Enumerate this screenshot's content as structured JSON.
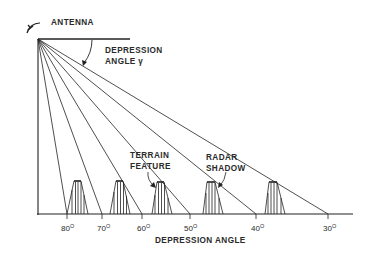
{
  "diagram": {
    "labels": {
      "antenna": "ANTENNA",
      "depression_line1": "DEPRESSION",
      "depression_line2": "ANGLE γ",
      "terrain_line1": "TERRAIN",
      "terrain_line2": "FEATURE",
      "shadow_line1": "RADAR",
      "shadow_line2": "SHADOW",
      "axis_title": "DEPRESSION ANGLE"
    },
    "ticks": [
      {
        "value": "80",
        "unit": "O",
        "x": 67
      },
      {
        "value": "70",
        "unit": "O",
        "x": 102
      },
      {
        "value": "60",
        "unit": "O",
        "x": 142
      },
      {
        "value": "50",
        "unit": "O",
        "x": 190
      },
      {
        "value": "40",
        "unit": "O",
        "x": 256
      },
      {
        "value": "30",
        "unit": "O",
        "x": 328
      }
    ],
    "colors": {
      "line": "#222222",
      "text": "#2a2a2a",
      "background": "#ffffff"
    }
  }
}
